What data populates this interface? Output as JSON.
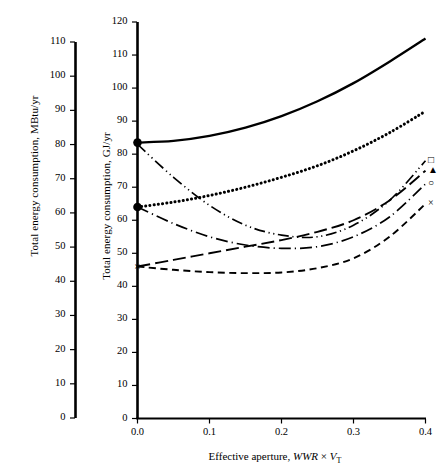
{
  "figure": {
    "background": "#ffffff",
    "foreground": "#000000"
  },
  "axes": {
    "left_secondary": {
      "title": "Total energy consumption, MBtu/yr",
      "ticks": [
        "0",
        "10",
        "20",
        "30",
        "40",
        "50",
        "60",
        "70",
        "80",
        "90",
        "100",
        "110"
      ],
      "min": 0,
      "max": 110
    },
    "left_primary": {
      "title": "Total energy consumption, GJ/yr",
      "ticks": [
        "0",
        "10",
        "20",
        "30",
        "40",
        "50",
        "60",
        "70",
        "80",
        "90",
        "100",
        "110",
        "120"
      ],
      "min": 0,
      "max": 120
    },
    "x": {
      "title_prefix": "Effective aperture, ",
      "title_italic_1": "WWR",
      "title_times": "×",
      "title_italic_2": "V",
      "title_sub": "T",
      "ticks": [
        "0.0",
        "0.1",
        "0.2",
        "0.3",
        "0.4"
      ],
      "min": 0.0,
      "max": 0.4
    }
  },
  "legend": {
    "position": "right-edge",
    "markers": [
      {
        "name": "square-marker",
        "glyph": "□"
      },
      {
        "name": "filled-triangle-marker",
        "glyph": "▲"
      },
      {
        "name": "circle-marker",
        "glyph": "○"
      },
      {
        "name": "cross-marker",
        "glyph": "×"
      }
    ]
  },
  "point_markers": [
    {
      "name": "filled-circle-top",
      "x": 0.0,
      "y": 83.5,
      "glyph": "●"
    },
    {
      "name": "filled-circle-mid",
      "x": 0.0,
      "y": 64.0,
      "glyph": "●"
    },
    {
      "name": "cross-low",
      "x": 0.0,
      "y": 46.0,
      "glyph": "×"
    }
  ],
  "chart_data": {
    "type": "line",
    "title": "",
    "xlabel": "Effective aperture, WWR × VT",
    "ylabel": "Total energy consumption, GJ/yr",
    "ylabel_secondary": "Total energy consumption, MBtu/yr",
    "xlim": [
      0.0,
      0.4
    ],
    "ylim": [
      0,
      120
    ],
    "ylim_secondary": [
      0,
      110
    ],
    "grid": false,
    "legend_position": "right-edge-markers",
    "x": [
      0.0,
      0.05,
      0.1,
      0.15,
      0.2,
      0.25,
      0.3,
      0.35,
      0.4
    ],
    "series": [
      {
        "name": "solid",
        "style": "solid",
        "end_marker": "none",
        "start_marker": "filled-circle",
        "values": [
          83.5,
          84.0,
          85.5,
          88.0,
          91.5,
          96.0,
          101.5,
          108.0,
          115.0
        ]
      },
      {
        "name": "dotted",
        "style": "dotted",
        "end_marker": "none",
        "start_marker": "filled-circle",
        "values": [
          64.0,
          65.5,
          67.5,
          70.0,
          73.0,
          76.5,
          81.0,
          86.5,
          93.0
        ]
      },
      {
        "name": "dash-dot-dot",
        "style": "dash-dot-dot",
        "end_marker": "square",
        "start_marker": "none",
        "values": [
          83.0,
          73.0,
          64.5,
          58.5,
          55.5,
          55.0,
          58.5,
          66.0,
          78.0
        ]
      },
      {
        "name": "long-dash",
        "style": "long-dash",
        "end_marker": "filled-triangle",
        "start_marker": "cross",
        "values": [
          46.0,
          48.0,
          50.0,
          52.0,
          54.0,
          56.5,
          60.0,
          66.0,
          75.0
        ]
      },
      {
        "name": "dash-dot",
        "style": "dash-dot",
        "end_marker": "circle",
        "start_marker": "filled-circle",
        "values": [
          64.0,
          59.0,
          55.0,
          52.5,
          51.5,
          52.0,
          55.0,
          61.0,
          71.0
        ]
      },
      {
        "name": "dashed",
        "style": "dashed",
        "end_marker": "cross",
        "start_marker": "cross",
        "values": [
          46.0,
          45.0,
          44.3,
          44.0,
          44.2,
          45.5,
          48.5,
          55.0,
          65.0
        ]
      }
    ]
  }
}
